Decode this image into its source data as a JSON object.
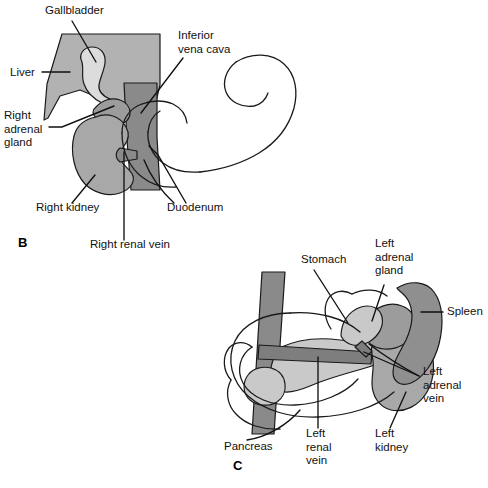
{
  "figure": {
    "background_color": "#ffffff",
    "line_color": "#111111"
  },
  "palette": {
    "liver_gray": "#b2b2b2",
    "gallbladder_light": "#dcdcdc",
    "ivc_dark": "#8a8a8a",
    "kidney_gray": "#a8a8a8",
    "adrenal_gray": "#9c9c9c",
    "pancreas_light": "#c9c9c9",
    "spleen_dark": "#8f8f8f",
    "aorta_dark": "#8a8a8a",
    "vein_dark": "#7e7e7e",
    "outline": "#1a1a1a"
  },
  "panels": [
    {
      "id": "panel-b",
      "letter": "B",
      "letter_x": 18,
      "letter_y": 247,
      "caption": "Right adrenal gland and its anatomical relations",
      "labels": [
        {
          "name": "gallbladder",
          "lines": [
            "Gallbladder"
          ],
          "x": 45,
          "y": 14,
          "anchor": "start"
        },
        {
          "name": "liver",
          "lines": [
            "Liver"
          ],
          "x": 10,
          "y": 76,
          "anchor": "start"
        },
        {
          "name": "inferior-vena-cava",
          "lines": [
            "Inferior",
            "vena cava"
          ],
          "x": 178,
          "y": 39,
          "anchor": "start"
        },
        {
          "name": "right-adrenal-gland",
          "lines": [
            "Right",
            "adrenal",
            "gland"
          ],
          "x": 4,
          "y": 119,
          "anchor": "start"
        },
        {
          "name": "right-kidney",
          "lines": [
            "Right kidney"
          ],
          "x": 36,
          "y": 211,
          "anchor": "start"
        },
        {
          "name": "duodenum",
          "lines": [
            "Duodenum"
          ],
          "x": 167,
          "y": 211,
          "anchor": "start"
        },
        {
          "name": "right-renal-vein",
          "lines": [
            "Right renal vein"
          ],
          "x": 90,
          "y": 248,
          "anchor": "start"
        }
      ]
    },
    {
      "id": "panel-c",
      "letter": "C",
      "letter_x": 233,
      "letter_y": 470,
      "caption": "Left adrenal gland and its anatomical relations",
      "labels": [
        {
          "name": "stomach",
          "lines": [
            "Stomach"
          ],
          "x": 301,
          "y": 263,
          "anchor": "start"
        },
        {
          "name": "left-adrenal-gland",
          "lines": [
            "Left",
            "adrenal",
            "gland"
          ],
          "x": 375,
          "y": 247,
          "anchor": "start"
        },
        {
          "name": "spleen",
          "lines": [
            "Spleen"
          ],
          "x": 447,
          "y": 315,
          "anchor": "start"
        },
        {
          "name": "left-adrenal-vein",
          "lines": [
            "Left",
            "adrenal",
            "vein"
          ],
          "x": 423,
          "y": 375,
          "anchor": "start"
        },
        {
          "name": "left-kidney",
          "lines": [
            "Left",
            "kidney"
          ],
          "x": 375,
          "y": 437,
          "anchor": "start"
        },
        {
          "name": "pancreas",
          "lines": [
            "Pancreas"
          ],
          "x": 224,
          "y": 450,
          "anchor": "start"
        },
        {
          "name": "left-renal-vein",
          "lines": [
            "Left",
            "renal",
            "vein"
          ],
          "x": 306,
          "y": 437,
          "anchor": "start"
        }
      ]
    }
  ]
}
